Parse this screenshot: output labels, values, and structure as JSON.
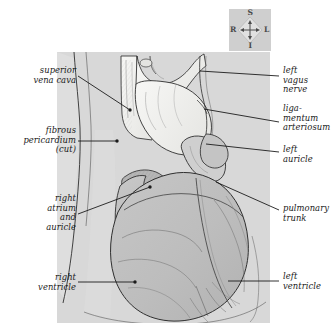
{
  "figure": {
    "panel_color": "#d8d8d8",
    "page_color": "#ffffff",
    "heart_fill": "#bcbcbc",
    "vessel_fill": "#f4f4f2",
    "pericardium_fill": "#efeeec",
    "line_color": "#2a2a2a",
    "leader_color": "#1c1c1c",
    "label_color": "#1a1a1a"
  },
  "orientation_compass": {
    "name": "orientation-compass",
    "background": "#cfcfcf",
    "superior": "S",
    "inferior": "I",
    "right": "R",
    "left": "L"
  },
  "labels_left": [
    {
      "id": "superior-vena-cava",
      "text": "superior\nvena cava",
      "x": 14,
      "y": 66,
      "width": 62,
      "leader": {
        "x1": 78,
        "y1": 76,
        "x2": 130,
        "y2": 110
      }
    },
    {
      "id": "fibrous-pericardium-cut",
      "text": "fibrous\npericardium\n(cut)",
      "x": 6,
      "y": 126,
      "width": 70,
      "leader": {
        "x1": 78,
        "y1": 141,
        "x2": 117,
        "y2": 141
      }
    },
    {
      "id": "right-atrium-and-auricle",
      "text": "right\natrium\nand\nauricle",
      "x": 16,
      "y": 194,
      "width": 60,
      "leader": {
        "x1": 78,
        "y1": 214,
        "x2": 150,
        "y2": 187
      }
    },
    {
      "id": "right-ventricle",
      "text": "right\nventricle",
      "x": 16,
      "y": 273,
      "width": 60,
      "leader": {
        "x1": 78,
        "y1": 282,
        "x2": 135,
        "y2": 282
      }
    }
  ],
  "labels_right": [
    {
      "id": "left-vagus-nerve",
      "text": "left\nvagus\nnerve",
      "x": 283,
      "y": 66,
      "width": 48,
      "leader": {
        "x1": 279,
        "y1": 76,
        "x2": 200,
        "y2": 71
      }
    },
    {
      "id": "ligamentum-arteriosum",
      "text": "liga-\nmentum\narteriosum",
      "x": 283,
      "y": 104,
      "width": 50,
      "leader": {
        "x1": 279,
        "y1": 122,
        "x2": 204,
        "y2": 109
      }
    },
    {
      "id": "left-auricle",
      "text": "left\nauricle",
      "x": 283,
      "y": 145,
      "width": 48,
      "leader": {
        "x1": 279,
        "y1": 152,
        "x2": 206,
        "y2": 144
      }
    },
    {
      "id": "pulmonary-trunk",
      "text": "pulmonary\ntrunk",
      "x": 283,
      "y": 204,
      "width": 50,
      "leader": {
        "x1": 279,
        "y1": 210,
        "x2": 216,
        "y2": 182
      }
    },
    {
      "id": "left-ventricle",
      "text": "left\nventricle",
      "x": 283,
      "y": 272,
      "width": 48,
      "leader": {
        "x1": 279,
        "y1": 281,
        "x2": 228,
        "y2": 281
      }
    }
  ]
}
